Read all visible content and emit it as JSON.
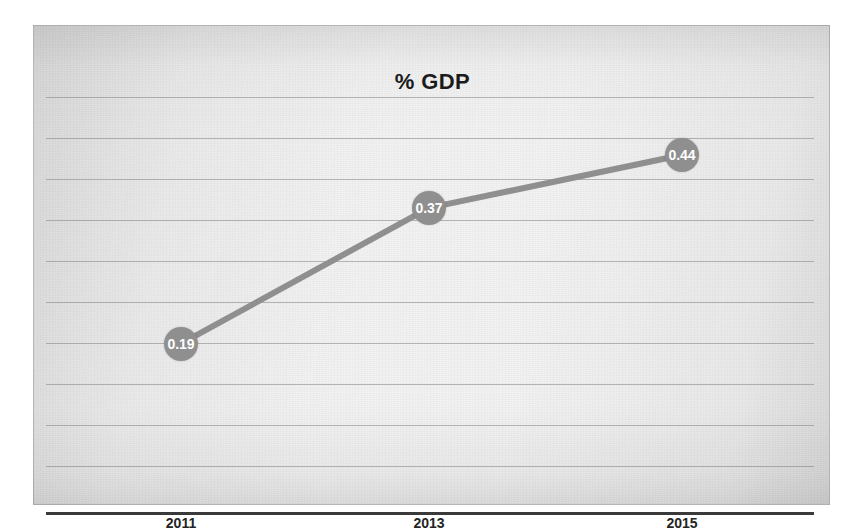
{
  "chart_data": {
    "type": "line",
    "title": "% GDP",
    "xlabel": "",
    "ylabel": "",
    "categories": [
      "2011",
      "2013",
      "2015"
    ],
    "values": [
      0.19,
      0.37,
      0.44
    ],
    "point_labels": [
      "0.19",
      "0.37",
      "0.44"
    ],
    "series": [
      {
        "name": "% GDP",
        "values": [
          0.19,
          0.37,
          0.44
        ]
      }
    ],
    "ylim": [
      0,
      0.55
    ],
    "grid": true,
    "gridline_count": 10,
    "legend": "none",
    "legend_position": "none",
    "marker": "circle",
    "data_labels_shown": true
  },
  "style": {
    "line_color": "#8f8f8f",
    "marker_color": "#8f8f8f",
    "marker_label_color": "#ffffff",
    "gridline_color": "#828282",
    "axis_color": "#3a3a3a",
    "title_color": "#1b1b1b",
    "tick_label_color": "#242424",
    "plot_background": "#f2f2f2"
  }
}
